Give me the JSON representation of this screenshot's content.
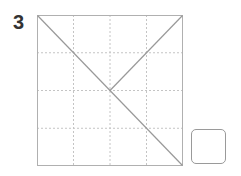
{
  "problem": {
    "number": "3"
  },
  "grid": {
    "rows": 4,
    "cols": 4,
    "frame_color": "#aaaaaa",
    "dash_color": "#c0c0c0",
    "line_color": "#999999",
    "lines": [
      {
        "from": "top-left",
        "to": "bottom-right"
      },
      {
        "from": "top-right",
        "to": "center"
      }
    ]
  },
  "answer_box": {
    "value": ""
  }
}
